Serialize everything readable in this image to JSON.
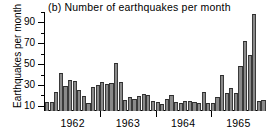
{
  "chart_data": {
    "type": "bar",
    "title": "(b) Number of earthquakes per month",
    "xlabel": "",
    "ylabel": "Earthquakes per month",
    "ylim": [
      5,
      100
    ],
    "y_major_ticks": [
      10,
      30,
      50,
      70,
      90
    ],
    "y_minor_ticks": [
      20,
      40,
      60,
      80,
      100
    ],
    "grid": false,
    "legend": "none",
    "x_axis_type": "monthly time series",
    "year_labels": [
      "1962",
      "1963",
      "1964",
      "1965"
    ],
    "year_boundary_ticks": [
      "1962|1963",
      "1963|1964",
      "1964|1965"
    ],
    "categories": [
      "1962-01",
      "1962-02",
      "1962-03",
      "1962-04",
      "1962-05",
      "1962-06",
      "1962-07",
      "1962-08",
      "1962-09",
      "1962-10",
      "1962-11",
      "1962-12",
      "1963-01",
      "1963-02",
      "1963-03",
      "1963-04",
      "1963-05",
      "1963-06",
      "1963-07",
      "1963-08",
      "1963-09",
      "1963-10",
      "1963-11",
      "1963-12",
      "1964-01",
      "1964-02",
      "1964-03",
      "1964-04",
      "1964-05",
      "1964-06",
      "1964-07",
      "1964-08",
      "1964-09",
      "1964-10",
      "1964-11",
      "1964-12",
      "1965-01",
      "1965-02",
      "1965-03",
      "1965-04",
      "1965-05",
      "1965-06",
      "1965-07",
      "1965-08",
      "1965-09",
      "1965-10",
      "1965-11",
      "1965-12"
    ],
    "values": [
      14,
      14,
      23,
      41,
      29,
      35,
      34,
      25,
      19,
      13,
      28,
      30,
      33,
      31,
      32,
      51,
      33,
      16,
      18,
      17,
      19,
      21,
      20,
      15,
      14,
      12,
      17,
      20,
      14,
      13,
      15,
      15,
      14,
      13,
      23,
      13,
      13,
      18,
      40,
      22,
      27,
      22,
      48,
      72,
      59,
      98,
      15,
      16
    ],
    "max_value": 98,
    "min_value": 12,
    "bar_fill_color": "#8a8a8a",
    "bar_edge_color": "#2e2e2e",
    "axis_color": "#000000",
    "background_color": "#ffffff"
  }
}
